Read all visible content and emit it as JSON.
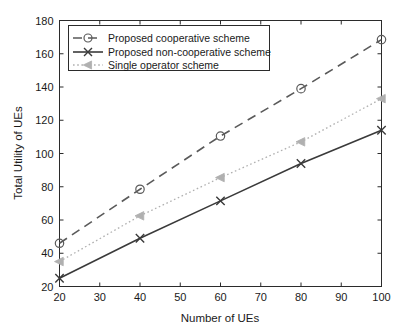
{
  "chart_data": {
    "type": "line",
    "title": "",
    "xlabel": "Number of UEs",
    "ylabel": "Total Utility of UEs",
    "x": [
      20,
      40,
      60,
      80,
      100
    ],
    "xlim": [
      20,
      100
    ],
    "ylim": [
      20,
      180
    ],
    "xticks": [
      20,
      30,
      40,
      50,
      60,
      70,
      80,
      90,
      100
    ],
    "yticks": [
      20,
      40,
      60,
      80,
      100,
      120,
      140,
      160,
      180
    ],
    "xticklabels": [
      "20",
      "30",
      "40",
      "50",
      "60",
      "70",
      "80",
      "90",
      "100"
    ],
    "yticklabels": [
      "20",
      "40",
      "60",
      "80",
      "100",
      "120",
      "140",
      "160",
      "180"
    ],
    "grid": false,
    "legend_position": "upper left",
    "series": [
      {
        "name": "Proposed cooperative scheme",
        "values": [
          46,
          78.5,
          110.5,
          139,
          168.5
        ],
        "marker": "circle",
        "linestyle": "dashed",
        "color": "#5a5a5a"
      },
      {
        "name": "Proposed non-cooperative scheme",
        "values": [
          25,
          49,
          71.5,
          94,
          114
        ],
        "marker": "x",
        "linestyle": "solid",
        "color": "#3a3a3a"
      },
      {
        "name": "Single operator scheme",
        "values": [
          35,
          62.5,
          85.5,
          107,
          133
        ],
        "marker": "triangle-left",
        "linestyle": "dotted",
        "color": "#b0b0b0"
      }
    ]
  },
  "axes": {
    "x_label": "Number of UEs",
    "y_label": "Total Utility of UEs"
  },
  "legend": {
    "items": [
      {
        "label": "Proposed cooperative scheme"
      },
      {
        "label": "Proposed non-cooperative scheme"
      },
      {
        "label": "Single operator scheme"
      }
    ]
  },
  "colors": {
    "axis": "#2b2b2b",
    "series_cooperative": "#5a5a5a",
    "series_noncooperative": "#3a3a3a",
    "series_single": "#b0b0b0",
    "background": "#ffffff"
  }
}
